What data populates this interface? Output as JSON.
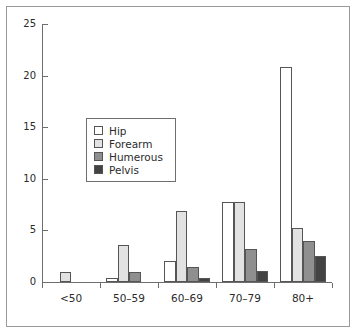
{
  "chart_data": {
    "type": "bar",
    "title": "",
    "xlabel": "",
    "ylabel": "",
    "categories": [
      "<50",
      "50–59",
      "60–69",
      "70–79",
      "80+"
    ],
    "series": [
      {
        "name": "Hip",
        "color": "#ffffff",
        "values": [
          0,
          0.4,
          2.0,
          7.8,
          20.8
        ]
      },
      {
        "name": "Forearm",
        "color": "#e2e2e2",
        "values": [
          1.0,
          3.6,
          6.9,
          7.8,
          5.2
        ]
      },
      {
        "name": "Humerous",
        "color": "#8f8f8f",
        "values": [
          0,
          1.0,
          1.5,
          3.2,
          4.0
        ]
      },
      {
        "name": "Pelvis",
        "color": "#434343",
        "values": [
          0,
          0,
          0.35,
          1.05,
          2.5
        ]
      }
    ],
    "ylim": [
      0,
      25
    ],
    "yticks": [
      0,
      5,
      10,
      15,
      20,
      25
    ],
    "ytick_labels": [
      "0",
      "5",
      "10",
      "15",
      "20",
      "25"
    ],
    "grid": false,
    "legend": {
      "position": "upper-center-left",
      "entries": [
        "Hip",
        "Forearm",
        "Humerous",
        "Pelvis"
      ]
    },
    "axis_color": "#6e6e6e",
    "bar_edge_color": "#555555",
    "frame_color": "#9a9a9a"
  }
}
